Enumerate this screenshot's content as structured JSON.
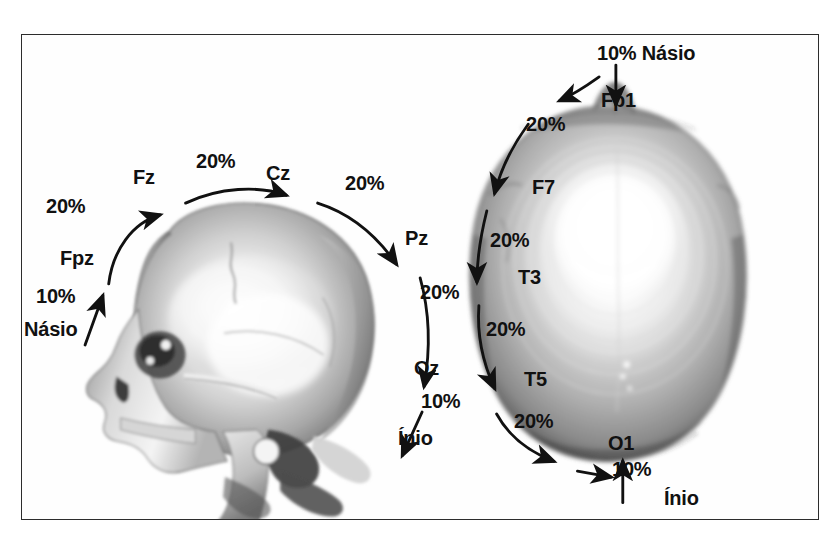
{
  "figure": {
    "border_color": "#2c2c2c",
    "background_color": "#ffffff",
    "text_color": "#111111"
  },
  "panels": [
    {
      "id": "lateral",
      "view_name": "lateral-skull-view",
      "labels": [
        {
          "name": "pct-nasio-fpz",
          "text": "10%",
          "kind": "percent",
          "x": 36,
          "y": 286
        },
        {
          "name": "landmark-nasio",
          "text": "Násio",
          "kind": "landmark",
          "x": 24,
          "y": 319
        },
        {
          "name": "electrode-fpz",
          "text": "Fpz",
          "kind": "electrode",
          "x": 60,
          "y": 248
        },
        {
          "name": "pct-fpz-fz",
          "text": "20%",
          "kind": "percent",
          "x": 46,
          "y": 196
        },
        {
          "name": "electrode-fz",
          "text": "Fz",
          "kind": "electrode",
          "x": 133,
          "y": 167
        },
        {
          "name": "pct-fz-cz",
          "text": "20%",
          "kind": "percent",
          "x": 196,
          "y": 151
        },
        {
          "name": "electrode-cz",
          "text": "Cz",
          "kind": "electrode",
          "x": 266,
          "y": 163
        },
        {
          "name": "pct-cz-pz",
          "text": "20%",
          "kind": "percent",
          "x": 345,
          "y": 173
        },
        {
          "name": "electrode-pz",
          "text": "Pz",
          "kind": "electrode",
          "x": 405,
          "y": 228
        },
        {
          "name": "pct-pz-oz",
          "text": "20%",
          "kind": "percent",
          "x": 420,
          "y": 282
        },
        {
          "name": "electrode-oz",
          "text": "Oz",
          "kind": "electrode",
          "x": 414,
          "y": 358
        },
        {
          "name": "pct-oz-inio",
          "text": "10%",
          "kind": "percent",
          "x": 421,
          "y": 391
        },
        {
          "name": "landmark-inio",
          "text": "Ínio",
          "kind": "landmark",
          "x": 398,
          "y": 428
        }
      ]
    },
    {
      "id": "superior",
      "view_name": "superior-skull-view",
      "labels": [
        {
          "name": "pct-nasio-fp1-top",
          "text": "10% Násio",
          "kind": "pct-landmark",
          "x": 597,
          "y": 43
        },
        {
          "name": "electrode-fp1",
          "text": "Fp1",
          "kind": "electrode",
          "x": 601,
          "y": 90
        },
        {
          "name": "pct-fp1-f7",
          "text": "20%",
          "kind": "percent",
          "x": 526,
          "y": 114
        },
        {
          "name": "electrode-f7",
          "text": "F7",
          "kind": "electrode",
          "x": 532,
          "y": 177
        },
        {
          "name": "pct-f7-t3",
          "text": "20%",
          "kind": "percent",
          "x": 490,
          "y": 230
        },
        {
          "name": "electrode-t3",
          "text": "T3",
          "kind": "electrode",
          "x": 518,
          "y": 267
        },
        {
          "name": "pct-t3-t5",
          "text": "20%",
          "kind": "percent",
          "x": 486,
          "y": 319
        },
        {
          "name": "electrode-t5",
          "text": "T5",
          "kind": "electrode",
          "x": 524,
          "y": 369
        },
        {
          "name": "pct-t5-o1",
          "text": "20%",
          "kind": "percent",
          "x": 514,
          "y": 411
        },
        {
          "name": "electrode-o1",
          "text": "O1",
          "kind": "electrode",
          "x": 608,
          "y": 433
        },
        {
          "name": "pct-o1-inio",
          "text": "10%",
          "kind": "percent",
          "x": 612,
          "y": 459
        },
        {
          "name": "landmark-inio-bottom",
          "text": "Ínio",
          "kind": "landmark",
          "x": 664,
          "y": 488
        }
      ]
    }
  ],
  "measurements": {
    "sagittal_chain": [
      "Násio",
      "Fpz",
      "Fz",
      "Cz",
      "Pz",
      "Oz",
      "Ínio"
    ],
    "sagittal_percents": [
      "10%",
      "20%",
      "20%",
      "20%",
      "20%",
      "10%"
    ],
    "coronal_chain": [
      "Násio",
      "Fp1",
      "F7",
      "T3",
      "T5",
      "O1",
      "Ínio"
    ],
    "coronal_percents": [
      "10%",
      "20%",
      "20%",
      "20%",
      "20%",
      "10%"
    ]
  }
}
